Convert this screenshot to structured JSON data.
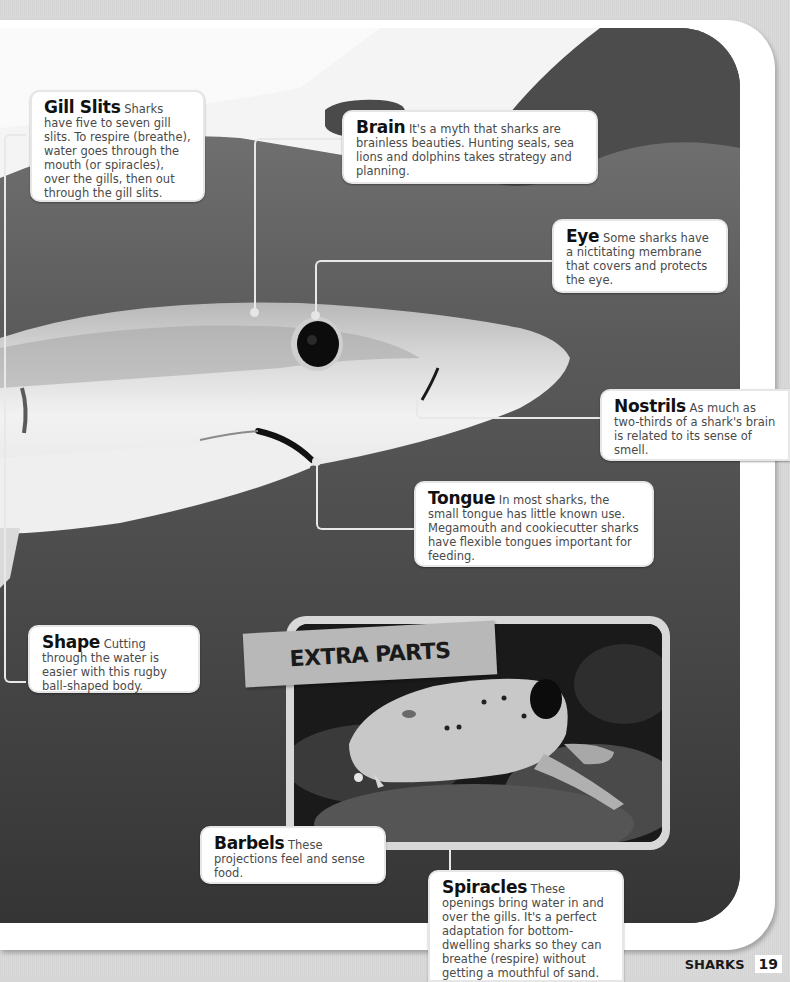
{
  "page": {
    "section_label": "SHARKS",
    "page_number": "19",
    "colors": {
      "background": "#d6d6d6",
      "frame": "#ffffff",
      "photo_water": "#3a3a3a",
      "callout_bg": "#ffffff",
      "title_text": "#111111",
      "body_text": "#4a4a4a",
      "banner_bg": "#b8b8b8"
    }
  },
  "callouts": [
    {
      "id": "gill-slits",
      "title": "Gill Slits",
      "body": " Sharks have five to seven gill slits. To respire (breathe), water goes through the mouth (or spiracles), over the gills, then out through the gill slits."
    },
    {
      "id": "brain",
      "title": "Brain",
      "body": " It's a myth that sharks are brainless beauties. Hunting seals, sea lions and dolphins takes strategy and planning."
    },
    {
      "id": "eye",
      "title": "Eye",
      "body": " Some sharks have a nictitating membrane that covers and protects the eye."
    },
    {
      "id": "nostrils",
      "title": "Nostrils",
      "body": " As much as two-thirds of a shark's brain is related to its sense of smell."
    },
    {
      "id": "tongue",
      "title": "Tongue",
      "body": " In most sharks, the small tongue has little known use. Megamouth and cookiecutter sharks have flexible tongues important for feeding."
    },
    {
      "id": "shape",
      "title": "Shape",
      "body": " Cutting through the water is easier with this rugby ball-shaped body."
    },
    {
      "id": "barbels",
      "title": "Barbels",
      "body": " These projections feel and sense food."
    },
    {
      "id": "spiracles",
      "title": "Spiracles",
      "body": " These openings bring water in and over the gills. It's a perfect adaptation for bottom-dwelling sharks so they can breathe (respire) without getting a mouthful of sand."
    }
  ],
  "inset": {
    "banner_label": "EXTRA PARTS"
  }
}
